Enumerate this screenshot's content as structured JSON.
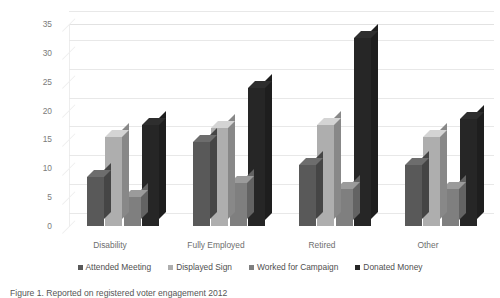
{
  "chart_data": {
    "type": "bar",
    "title": "",
    "xlabel": "",
    "ylabel": "Percent Reporting Involvement",
    "ylim": [
      0,
      35
    ],
    "ytick_step": 5,
    "yticks": [
      35,
      30,
      25,
      20,
      15,
      10,
      5,
      0
    ],
    "grid": true,
    "legend_position": "bottom",
    "style": "3d-clustered-column",
    "categories": [
      "Disability",
      "Fully Employed",
      "Retired",
      "Other"
    ],
    "series": [
      {
        "name": "Attended Meeting",
        "color": "#595959",
        "values": [
          8.5,
          14.5,
          10.5,
          10.5
        ]
      },
      {
        "name": "Displayed Sign",
        "color": "#aeaeae",
        "values": [
          15.5,
          17.0,
          17.5,
          15.5
        ]
      },
      {
        "name": "Worked for Campaign",
        "color": "#7f7f7f",
        "values": [
          5.0,
          7.5,
          6.5,
          6.5
        ]
      },
      {
        "name": "Donated Money",
        "color": "#262626",
        "values": [
          17.5,
          24.0,
          32.5,
          18.5
        ]
      }
    ]
  },
  "caption": "Figure 1. Reported on registered voter engagement 2012",
  "colors": {
    "gridline": "#e8e8e8",
    "axis_text": "#7b7b7b",
    "label_text": "#6e6e6e",
    "background": "#ffffff"
  }
}
